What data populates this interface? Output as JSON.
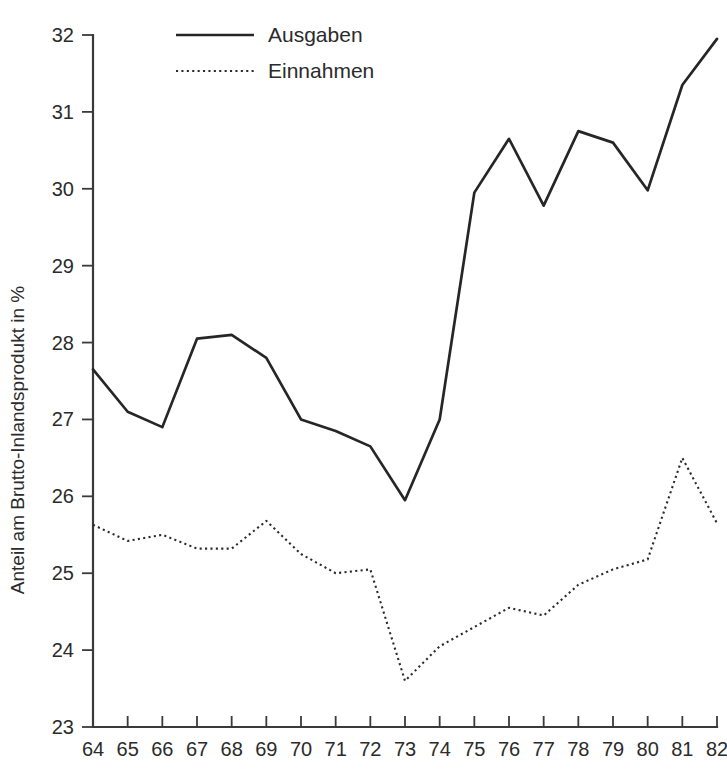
{
  "chart_data": {
    "type": "line",
    "title": "",
    "xlabel": "",
    "ylabel": "Anteil am Brutto-Inlandsprodukt in %",
    "xlim": [
      64,
      82
    ],
    "ylim": [
      23,
      32
    ],
    "grid": false,
    "legend_position": "top-center",
    "x": [
      64,
      65,
      66,
      67,
      68,
      69,
      70,
      71,
      72,
      73,
      74,
      75,
      76,
      77,
      78,
      79,
      80,
      81,
      82
    ],
    "categories": [
      "64",
      "65",
      "66",
      "67",
      "68",
      "69",
      "70",
      "71",
      "72",
      "73",
      "74",
      "75",
      "76",
      "77",
      "78",
      "79",
      "80",
      "81",
      "82"
    ],
    "xticks": [
      "64",
      "65",
      "66",
      "67",
      "68",
      "69",
      "70",
      "71",
      "72",
      "73",
      "74",
      "75",
      "76",
      "77",
      "78",
      "79",
      "80",
      "81",
      "82"
    ],
    "yticks": [
      "23",
      "24",
      "25",
      "26",
      "27",
      "28",
      "29",
      "30",
      "31",
      "32"
    ],
    "series": [
      {
        "name": "Ausgaben",
        "style": "solid",
        "color": "#262626",
        "values": [
          27.65,
          27.1,
          26.9,
          28.05,
          28.1,
          27.8,
          27.0,
          26.85,
          26.65,
          25.95,
          27.0,
          29.95,
          30.65,
          29.78,
          30.75,
          30.6,
          29.98,
          31.35,
          31.95
        ]
      },
      {
        "name": "Einnahmen",
        "style": "dotted",
        "color": "#2b2b2b",
        "values": [
          25.63,
          25.42,
          25.5,
          25.32,
          25.32,
          25.68,
          25.25,
          25.0,
          25.05,
          23.6,
          24.05,
          24.3,
          24.55,
          24.45,
          24.85,
          25.05,
          25.18,
          26.5,
          25.65
        ]
      }
    ]
  },
  "legend": {
    "items": [
      {
        "label": "Ausgaben",
        "style": "solid"
      },
      {
        "label": "Einnahmen",
        "style": "dotted"
      }
    ]
  },
  "axes": {
    "y_title": "Anteil am Brutto-Inlandsprodukt in %"
  }
}
